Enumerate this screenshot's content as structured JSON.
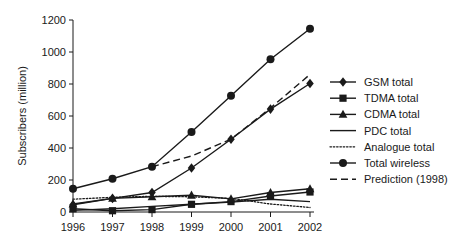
{
  "chart_data": {
    "type": "line",
    "title": "",
    "xlabel": "",
    "ylabel": "Subscribers (million)",
    "x": [
      1996,
      1997,
      1998,
      1999,
      2000,
      2001,
      2002
    ],
    "categories": [
      "1996",
      "1997",
      "1998",
      "1999",
      "2000",
      "2001",
      "2002"
    ],
    "xlim": [
      1996,
      2002
    ],
    "ylim": [
      0,
      1200
    ],
    "yticks": [
      0,
      200,
      400,
      600,
      800,
      1000,
      1200
    ],
    "ytick_labels": [
      "0",
      "200",
      "400",
      "600",
      "800",
      "1000",
      "1200"
    ],
    "grid": false,
    "legend_position": "right",
    "series": [
      {
        "name": "GSM total",
        "marker": "diamond",
        "line_style": "solid",
        "color": "#1a1a1a",
        "x": [
          1996,
          1997,
          1998,
          1999,
          2000,
          2001,
          2002
        ],
        "values": [
          45,
          85,
          122,
          275,
          455,
          643,
          803
        ]
      },
      {
        "name": "TDMA total",
        "marker": "square",
        "line_style": "solid",
        "color": "#1a1a1a",
        "x": [
          1996,
          1997,
          1998,
          1999,
          2000,
          2001,
          2002
        ],
        "values": [
          20,
          8,
          15,
          48,
          65,
          100,
          125
        ]
      },
      {
        "name": "CDMA total",
        "marker": "triangle",
        "line_style": "solid",
        "color": "#1a1a1a",
        "x": [
          1996,
          1997,
          1998,
          1999,
          2000,
          2001,
          2002
        ],
        "values": [
          50,
          85,
          95,
          105,
          82,
          122,
          145
        ]
      },
      {
        "name": "PDC total",
        "marker": "none",
        "line_style": "solid",
        "color": "#1a1a1a",
        "x": [
          1996,
          1997,
          1998,
          1999,
          2000,
          2001,
          2002
        ],
        "values": [
          10,
          20,
          35,
          48,
          62,
          80,
          65
        ]
      },
      {
        "name": "Analogue total",
        "marker": "none",
        "line_style": "dotted",
        "color": "#1a1a1a",
        "x": [
          1996,
          1997,
          1998,
          1999,
          2000,
          2001,
          2002
        ],
        "values": [
          80,
          92,
          98,
          95,
          85,
          50,
          28
        ]
      },
      {
        "name": "Total wireless",
        "marker": "circle",
        "line_style": "solid",
        "color": "#1a1a1a",
        "x": [
          1996,
          1997,
          1998,
          1999,
          2000,
          2001,
          2002
        ],
        "values": [
          145,
          208,
          283,
          500,
          727,
          955,
          1145
        ]
      },
      {
        "name": "Prediction (1998)",
        "marker": "none",
        "line_style": "dashed",
        "color": "#1a1a1a",
        "x": [
          1998,
          1999,
          2000,
          2001,
          2002
        ],
        "values": [
          283,
          350,
          455,
          650,
          860
        ]
      }
    ]
  },
  "legend": {
    "entries": [
      {
        "label": "GSM total",
        "marker": "diamond",
        "line_style": "solid"
      },
      {
        "label": "TDMA total",
        "marker": "square",
        "line_style": "solid"
      },
      {
        "label": "CDMA total",
        "marker": "triangle",
        "line_style": "solid"
      },
      {
        "label": "PDC total",
        "marker": "none",
        "line_style": "solid"
      },
      {
        "label": "Analogue total",
        "marker": "none",
        "line_style": "dotted"
      },
      {
        "label": "Total wireless",
        "marker": "circle",
        "line_style": "solid"
      },
      {
        "label": "Prediction (1998)",
        "marker": "none",
        "line_style": "dashed"
      }
    ]
  },
  "axes": {
    "y_title": "Subscribers (million)"
  },
  "colors": {
    "ink": "#1a1a1a",
    "background": "#ffffff"
  }
}
